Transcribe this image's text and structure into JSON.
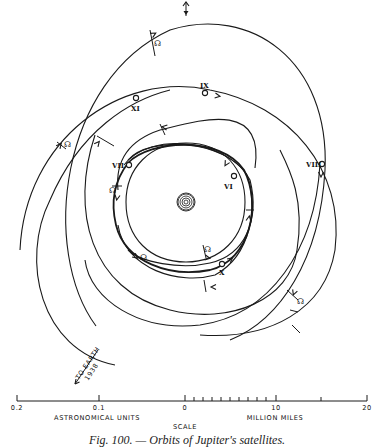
{
  "figure": {
    "caption": "Fig. 100. — Orbits of Jupiter's satellites.",
    "north_arrow": {
      "x": 186,
      "y1": 2,
      "y2": 16
    },
    "jupiter": {
      "cx": 186,
      "cy": 202,
      "rings": [
        2,
        4,
        6,
        8
      ],
      "outer": 9
    },
    "orbits": [
      {
        "id": "orbit-outer-top",
        "d": "M 96 326 C 40 250, 60 80, 170 30 C 250 5, 330 60, 325 170 C 320 260, 280 320, 230 340",
        "heavy": false
      },
      {
        "id": "orbit-IX",
        "d": "M 20 250 C 25 140, 120 70, 210 90 C 290 105, 345 170, 335 250 C 325 310, 270 340, 200 335",
        "heavy": false
      },
      {
        "id": "orbit-left-big",
        "d": "M 115 365 C 40 350, 20 260, 50 200 C 80 130, 130 100, 170 90",
        "heavy": false
      },
      {
        "id": "orbit-XI",
        "d": "M 95 135 C 70 210, 90 290, 170 310 C 230 325, 290 300, 297 250 C 305 200, 290 170, 280 150",
        "heavy": false
      },
      {
        "id": "orbit-VIII",
        "d": "M 320 164 C 315 250, 270 315, 200 325 C 140 332, 90 300, 85 260",
        "heavy": false
      },
      {
        "id": "orbit-XII",
        "d": "M 255 168 C 265 100, 200 120, 160 130 C 130 140, 115 160, 118 190",
        "heavy": false
      },
      {
        "id": "orbit-VI",
        "d": "M 128 163 C 150 140, 220 135, 244 170 C 262 205, 250 260, 210 270 C 170 278, 125 262, 116 225 C 110 200, 115 180, 128 163",
        "heavy": true
      },
      {
        "id": "orbit-VII",
        "d": "M 128 160 C 150 135, 225 140, 247 175 C 258 205, 252 255, 215 275 C 180 285, 125 270, 118 225",
        "heavy": false
      },
      {
        "id": "orbit-X",
        "d": "M 124 165 C 150 130, 230 140, 250 180 C 260 220, 245 255, 210 263 C 180 270, 140 262, 128 250",
        "heavy": false
      },
      {
        "id": "orbit-inner-ring",
        "d": "M 186 143 C 225 143, 245 170, 245 202 C 245 238, 220 262, 186 262 C 150 262, 126 238, 126 202 C 126 168, 150 143, 186 143 Z",
        "heavy": false
      }
    ],
    "satellites": [
      {
        "label": "XI",
        "cx": 136,
        "cy": 98,
        "lx": 131,
        "ly": 111
      },
      {
        "label": "IX",
        "cx": 205,
        "cy": 93,
        "lx": 200,
        "ly": 88
      },
      {
        "label": "VII",
        "cx": 129,
        "cy": 165,
        "lx": 112,
        "ly": 168
      },
      {
        "label": "VI",
        "cx": 234,
        "cy": 176,
        "lx": 224,
        "ly": 189
      },
      {
        "label": "VIII",
        "cx": 322,
        "cy": 164,
        "lx": 306,
        "ly": 167
      },
      {
        "label": "X",
        "cx": 222,
        "cy": 264,
        "lx": 219,
        "ly": 275
      }
    ],
    "nodes": [
      {
        "x": 154,
        "y": 46
      },
      {
        "x": 64,
        "y": 147
      },
      {
        "x": 109,
        "y": 193
      },
      {
        "x": 140,
        "y": 260
      },
      {
        "x": 204,
        "y": 252
      },
      {
        "x": 297,
        "y": 304
      }
    ],
    "node_symbol": "☊",
    "ticks": [
      [
        150,
        30,
        155,
        56
      ],
      [
        57,
        142,
        66,
        149
      ],
      [
        97,
        136,
        114,
        146
      ],
      [
        160,
        124,
        165,
        135
      ],
      [
        112,
        186,
        122,
        186
      ],
      [
        203,
        245,
        206,
        258
      ],
      [
        287,
        290,
        298,
        300
      ],
      [
        292,
        325,
        300,
        333
      ],
      [
        204,
        280,
        206,
        292
      ],
      [
        290,
        310,
        298,
        312
      ],
      [
        246,
        210,
        254,
        210
      ]
    ],
    "arrows": [
      {
        "x": 154,
        "y": 34,
        "r": -30
      },
      {
        "x": 60,
        "y": 145,
        "r": -50
      },
      {
        "x": 98,
        "y": 143,
        "r": -50
      },
      {
        "x": 218,
        "y": 96,
        "r": 10
      },
      {
        "x": 164,
        "y": 127,
        "r": -170
      },
      {
        "x": 226,
        "y": 164,
        "r": 120
      },
      {
        "x": 117,
        "y": 198,
        "r": 100
      },
      {
        "x": 321,
        "y": 175,
        "r": 90
      },
      {
        "x": 208,
        "y": 258,
        "r": 10
      },
      {
        "x": 249,
        "y": 218,
        "r": -80
      },
      {
        "x": 213,
        "y": 287,
        "r": 180
      },
      {
        "x": 294,
        "y": 293,
        "r": 110
      },
      {
        "x": 136,
        "y": 257,
        "r": 40
      },
      {
        "x": 231,
        "y": 259,
        "r": -40
      }
    ],
    "earth_pointer": {
      "label_line1": "TO EARTH",
      "label_line2": "1938",
      "x1": 98,
      "y1": 350,
      "x2": 75,
      "y2": 384
    },
    "scale": {
      "title": "SCALE",
      "au_label": "ASTRONOMICAL UNITS",
      "miles_label": "MILLION MILES",
      "ticks_au": [
        {
          "label": "0.2",
          "x": 17
        },
        {
          "label": "0.1",
          "x": 99
        },
        {
          "label": "0",
          "x": 185
        }
      ],
      "ticks_miles": [
        {
          "label": "10",
          "x": 276
        },
        {
          "label": "20",
          "x": 367
        }
      ],
      "minor_ticks_x": [
        194,
        203,
        212,
        221,
        230,
        239,
        248,
        257,
        266,
        321
      ],
      "baseline_y": 401
    }
  }
}
